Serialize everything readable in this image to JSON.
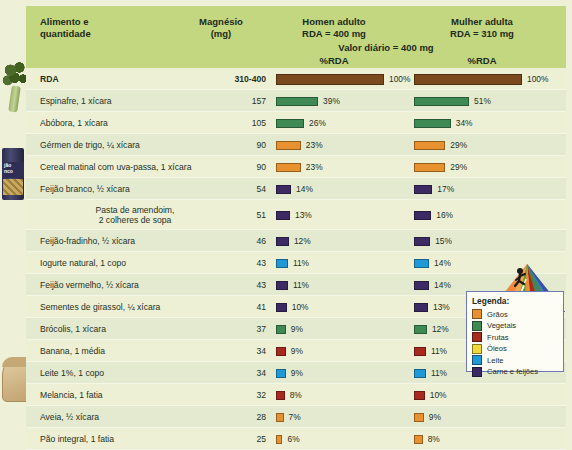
{
  "header": {
    "col_food": "Alimento e\nquantidade",
    "col_food_l1": "Alimento e",
    "col_food_l2": "quantidade",
    "col_mg_l1": "Magnésio",
    "col_mg_l2": "(mg)",
    "col_man_l1": "Homen adulto",
    "col_man_l2": "RDA = 400 mg",
    "col_woman_l1": "Mulher adulta",
    "col_woman_l2": "RDA = 310 mg",
    "daily_value": "Valor diário = 400 mg",
    "pct_rda_men": "%RDA",
    "pct_rda_women": "%RDA"
  },
  "colors": {
    "header_bg": "#c3d780",
    "row_bg": "#edf0d5",
    "row_alt_bg": "#e4ead0",
    "graos": "#e8922f",
    "vegetais": "#3f8a54",
    "frutas": "#a8291f",
    "oleos": "#f2d93b",
    "leite": "#1f9ad6",
    "carne_feijoes": "#3c2a63",
    "rda_bar": "#7a4a1e",
    "legend_border": "#6f79b8"
  },
  "chart_data": {
    "type": "bar",
    "series": [
      {
        "name": "Homen adulto (RDA = 400 mg)",
        "values": [
          100,
          39,
          26,
          23,
          23,
          14,
          13,
          12,
          11,
          11,
          10,
          9,
          9,
          9,
          8,
          7,
          6
        ]
      },
      {
        "name": "Mulher adulta (RDA = 310 mg)",
        "values": [
          100,
          51,
          34,
          29,
          29,
          17,
          16,
          15,
          14,
          14,
          13,
          12,
          11,
          11,
          10,
          9,
          8
        ]
      }
    ],
    "categories": [
      "RDA",
      "Espinafre, 1 xícara",
      "Abóbora, 1 xícara",
      "Gérmen de trigo, ¼ xícara",
      "Cereal matinal com uva-passa, 1 xícara",
      "Feijão branco, ½ xícara",
      "Pasta de amendoim, 2 colheres de sopa",
      "Feijão-fradinho, ½ xícara",
      "Iogurte natural, 1 copo",
      "Feijão vermelho, ½ xícara",
      "Sementes de girassol, ¼ xícara",
      "Brócolis, 1 xícara",
      "Banana, 1 média",
      "Leite 1%, 1 copo",
      "Melancia, 1 fatia",
      "Aveia, ½ xícara",
      "Pão integral, 1 fatia"
    ],
    "magnesium_mg": [
      "310-400",
      "157",
      "105",
      "90",
      "90",
      "54",
      "51",
      "46",
      "43",
      "43",
      "41",
      "37",
      "34",
      "34",
      "32",
      "28",
      "25"
    ],
    "xlabel": "%RDA",
    "ylabel": "",
    "xlim": [
      0,
      100
    ]
  },
  "rows": [
    {
      "food": "RDA",
      "food_l2": "",
      "mg": "310-400",
      "men_pct": "100%",
      "men_val": 100,
      "women_pct": "100%",
      "women_val": 100,
      "group": "rda",
      "bold": true,
      "tall": false
    },
    {
      "food": "Espinafre, 1 xícara",
      "food_l2": "",
      "mg": "157",
      "men_pct": "39%",
      "men_val": 39,
      "women_pct": "51%",
      "women_val": 51,
      "group": "vegetais",
      "bold": false,
      "tall": false
    },
    {
      "food": "Abóbora, 1 xícara",
      "food_l2": "",
      "mg": "105",
      "men_pct": "26%",
      "men_val": 26,
      "women_pct": "34%",
      "women_val": 34,
      "group": "vegetais",
      "bold": false,
      "tall": false
    },
    {
      "food": "Gérmen de trigo, ¼ xícara",
      "food_l2": "",
      "mg": "90",
      "men_pct": "23%",
      "men_val": 23,
      "women_pct": "29%",
      "women_val": 29,
      "group": "graos",
      "bold": false,
      "tall": false
    },
    {
      "food": "Cereal matinal com uva-passa, 1 xícara",
      "food_l2": "",
      "mg": "90",
      "men_pct": "23%",
      "men_val": 23,
      "women_pct": "29%",
      "women_val": 29,
      "group": "graos",
      "bold": false,
      "tall": false
    },
    {
      "food": "Feijão branco, ½ xícara",
      "food_l2": "",
      "mg": "54",
      "men_pct": "14%",
      "men_val": 14,
      "women_pct": "17%",
      "women_val": 17,
      "group": "carne",
      "bold": false,
      "tall": false
    },
    {
      "food": "Pasta de amendoim,",
      "food_l2": "2 colheres de sopa",
      "mg": "51",
      "men_pct": "13%",
      "men_val": 13,
      "women_pct": "16%",
      "women_val": 16,
      "group": "carne",
      "bold": false,
      "tall": true
    },
    {
      "food": "Feijão-fradinho, ½ xícara",
      "food_l2": "",
      "mg": "46",
      "men_pct": "12%",
      "men_val": 12,
      "women_pct": "15%",
      "women_val": 15,
      "group": "carne",
      "bold": false,
      "tall": false
    },
    {
      "food": "Iogurte natural, 1 copo",
      "food_l2": "",
      "mg": "43",
      "men_pct": "11%",
      "men_val": 11,
      "women_pct": "14%",
      "women_val": 14,
      "group": "leite",
      "bold": false,
      "tall": false
    },
    {
      "food": "Feijão vermelho, ½ xícara",
      "food_l2": "",
      "mg": "43",
      "men_pct": "11%",
      "men_val": 11,
      "women_pct": "14%",
      "women_val": 14,
      "group": "carne",
      "bold": false,
      "tall": false
    },
    {
      "food": "Sementes de girassol, ¼ xícara",
      "food_l2": "",
      "mg": "41",
      "men_pct": "10%",
      "men_val": 10,
      "women_pct": "13%",
      "women_val": 13,
      "group": "carne",
      "bold": false,
      "tall": false
    },
    {
      "food": "Brócolis, 1 xícara",
      "food_l2": "",
      "mg": "37",
      "men_pct": "9%",
      "men_val": 9,
      "women_pct": "12%",
      "women_val": 12,
      "group": "vegetais",
      "bold": false,
      "tall": false
    },
    {
      "food": "Banana, 1 média",
      "food_l2": "",
      "mg": "34",
      "men_pct": "9%",
      "men_val": 9,
      "women_pct": "11%",
      "women_val": 11,
      "group": "frutas",
      "bold": false,
      "tall": false
    },
    {
      "food": "Leite 1%, 1 copo",
      "food_l2": "",
      "mg": "34",
      "men_pct": "9%",
      "men_val": 9,
      "women_pct": "11%",
      "women_val": 11,
      "group": "leite",
      "bold": false,
      "tall": false
    },
    {
      "food": "Melancia, 1 fatia",
      "food_l2": "",
      "mg": "32",
      "men_pct": "8%",
      "men_val": 8,
      "women_pct": "10%",
      "women_val": 10,
      "group": "frutas",
      "bold": false,
      "tall": false
    },
    {
      "food": "Aveia, ½ xícara",
      "food_l2": "",
      "mg": "28",
      "men_pct": "7%",
      "men_val": 7,
      "women_pct": "9%",
      "women_val": 9,
      "group": "graos",
      "bold": false,
      "tall": false
    },
    {
      "food": "Pão integral, 1 fatia",
      "food_l2": "",
      "mg": "25",
      "men_pct": "6%",
      "men_val": 6,
      "women_pct": "8%",
      "women_val": 8,
      "group": "graos",
      "bold": false,
      "tall": false
    }
  ],
  "legend": {
    "title": "Legenda:",
    "items": [
      {
        "label": "Grãos",
        "color": "#e8922f"
      },
      {
        "label": "Vegetais",
        "color": "#3f8a54"
      },
      {
        "label": "Frutas",
        "color": "#a8291f"
      },
      {
        "label": "Óleos",
        "color": "#f2d93b"
      },
      {
        "label": "Leite",
        "color": "#1f9ad6"
      },
      {
        "label": "Carne e feijões",
        "color": "#3c2a63"
      }
    ]
  },
  "decor": {
    "broccoli": "broccoli-photo",
    "bean_can": "bean-can-photo",
    "bean_can_l1": "jão",
    "bean_can_l2": "nco",
    "bread": "bread-slice-photo",
    "pyramid": "food-pyramid-graphic"
  }
}
